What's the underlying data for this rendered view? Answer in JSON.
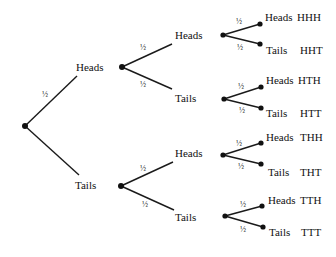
{
  "diagram": {
    "type": "probability-tree",
    "branch_probability": "½",
    "levels": {
      "level1": [
        {
          "label": "Heads",
          "prob": "½",
          "show_prob": true
        },
        {
          "label": "Tails",
          "prob": "½",
          "show_prob": false
        }
      ]
    },
    "nodes": {
      "root": {
        "id": "root"
      },
      "H": {
        "label": "Heads"
      },
      "T": {
        "label": "Tails"
      },
      "HH": {
        "label": "Heads"
      },
      "HT": {
        "label": "Tails"
      },
      "TH": {
        "label": "Heads"
      },
      "TT": {
        "label": "Tails"
      }
    },
    "leaves": [
      {
        "path": "HH",
        "label": "Heads",
        "outcome": "HHH"
      },
      {
        "path": "HH",
        "label": "Tails",
        "outcome": "HHT"
      },
      {
        "path": "HT",
        "label": "Heads",
        "outcome": "HTH"
      },
      {
        "path": "HT",
        "label": "Tails",
        "outcome": "HTT"
      },
      {
        "path": "TH",
        "label": "Heads",
        "outcome": "THH"
      },
      {
        "path": "TH",
        "label": "Tails",
        "outcome": "THT"
      },
      {
        "path": "TT",
        "label": "Heads",
        "outcome": "TTH"
      },
      {
        "path": "TT",
        "label": "Tails",
        "outcome": "TTT"
      }
    ]
  }
}
